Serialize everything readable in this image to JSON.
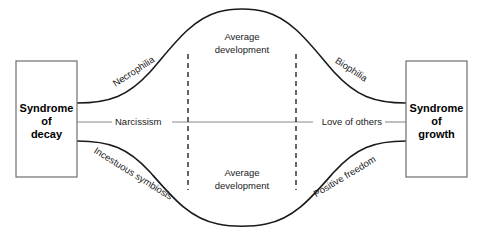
{
  "diagram": {
    "background_color": "#ffffff",
    "line_color": "#1a1a1a",
    "axis_color": "#8a8a8a",
    "box_border_color": "#6e6e6e",
    "left_node": {
      "line1": "Syndrome",
      "line2": "of",
      "line3": "decay"
    },
    "right_node": {
      "line1": "Syndrome",
      "line2": "of",
      "line3": "growth"
    },
    "upper_curve": {
      "left_label": "Necrophilia",
      "right_label": "Biophilia",
      "center_label_line1": "Average",
      "center_label_line2": "development"
    },
    "middle_axis": {
      "left_label": "Narcissism",
      "right_label": "Love of others"
    },
    "lower_curve": {
      "left_label": "Incestuous symbiosis",
      "right_label": "Positive freedom",
      "center_label_line1": "Average",
      "center_label_line2": "development"
    }
  }
}
